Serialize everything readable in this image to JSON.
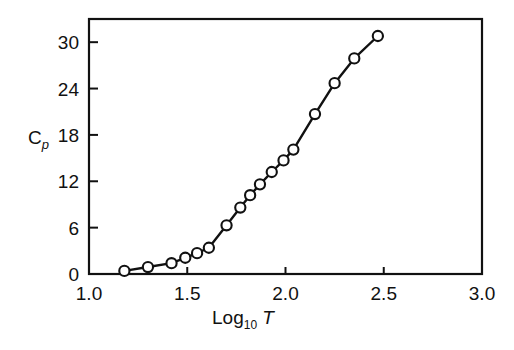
{
  "figure": {
    "background_color": "#ffffff",
    "ink_color": "#111111"
  },
  "chart_data": {
    "type": "line",
    "title": "",
    "subtitle": "",
    "xlabel_parts": {
      "main": "Log",
      "subscript": "10",
      "variable": "T"
    },
    "xlabel": "Log10 T",
    "ylabel_parts": {
      "main": "C",
      "subscript": "p"
    },
    "ylabel": "Cp",
    "xlim": [
      1.0,
      3.0
    ],
    "ylim": [
      0,
      33
    ],
    "xticks": [
      1.0,
      1.5,
      2.0,
      2.5,
      3.0
    ],
    "xtick_labels": [
      "1.0",
      "1.5",
      "2.0",
      "2.5",
      "3.0"
    ],
    "yticks": [
      0,
      6,
      12,
      18,
      24,
      30
    ],
    "ytick_labels": [
      "0",
      "6",
      "12",
      "18",
      "24",
      "30"
    ],
    "grid": false,
    "legend": null,
    "marker": "open-circle",
    "marker_fill": "#ffffff",
    "line_color": "#111111",
    "series": [
      {
        "name": "Cp vs Log10 T",
        "x": [
          1.18,
          1.3,
          1.42,
          1.49,
          1.55,
          1.61,
          1.7,
          1.77,
          1.82,
          1.87,
          1.93,
          1.99,
          2.04,
          2.15,
          2.25,
          2.35,
          2.47
        ],
        "y": [
          0.4,
          0.9,
          1.4,
          2.1,
          2.7,
          3.4,
          6.3,
          8.6,
          10.2,
          11.6,
          13.2,
          14.7,
          16.1,
          20.7,
          24.7,
          27.9,
          30.8
        ]
      }
    ],
    "annotations": []
  }
}
